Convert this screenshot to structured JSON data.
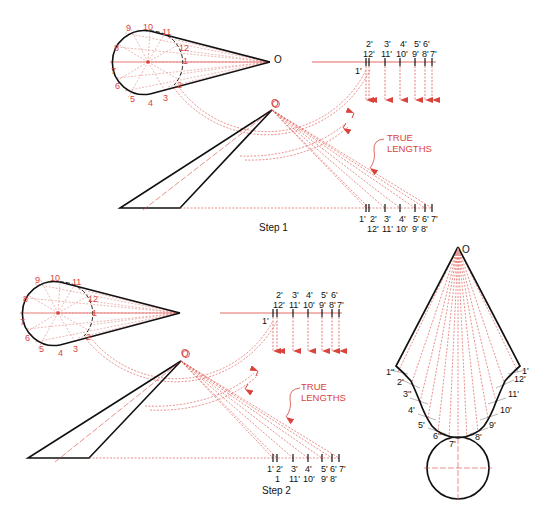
{
  "figure": {
    "colors": {
      "construction": "#d9443c",
      "outline": "#111111",
      "background": "#ffffff"
    }
  },
  "step1": {
    "caption": "Step 1",
    "apex_label": "O",
    "elevation_apex_label": "O",
    "plan_points": [
      "1",
      "2",
      "3",
      "4",
      "5",
      "6",
      "7",
      "8",
      "9",
      "10",
      "11",
      "12"
    ],
    "top_scale_upper": [
      "2'",
      "3'",
      "4'",
      "5'",
      "6'"
    ],
    "top_scale_lower": [
      "12'",
      "11'",
      "10'",
      "9'",
      "8'",
      "7'"
    ],
    "top_scale_side": "1'",
    "bottom_scale_upper": [
      "1'",
      "2'",
      "3'",
      "4'",
      "5'",
      "6'",
      "7'"
    ],
    "bottom_scale_lower": [
      "12'",
      "11'",
      "10'",
      "9'",
      "8'"
    ],
    "annotation": [
      "TRUE",
      "LENGTHS"
    ]
  },
  "step2": {
    "caption": "Step 2",
    "apex_label": "O",
    "plan_points": [
      "1",
      "2",
      "3",
      "4",
      "5",
      "6",
      "7",
      "8",
      "9",
      "10",
      "11",
      "12"
    ],
    "top_scale_upper": [
      "2'",
      "3'",
      "4'",
      "5'",
      "6'"
    ],
    "top_scale_lower": [
      "12'",
      "11'",
      "10'",
      "9'",
      "8'",
      "7'"
    ],
    "top_scale_side": "1'",
    "bottom_scale_upper": [
      "1'",
      "2'",
      "3'",
      "4'",
      "5'",
      "6'",
      "7'"
    ],
    "bottom_scale_lower": [
      "1",
      "11'",
      "10'",
      "9'",
      "8'"
    ],
    "annotation": [
      "TRUE",
      "LENGTHS"
    ]
  },
  "development": {
    "apex_label": "O",
    "left_labels": [
      "1''",
      "2'",
      "3''",
      "4'",
      "5'",
      "6''",
      "7'"
    ],
    "right_labels": [
      "1'",
      "12'",
      "11'",
      "10'",
      "9'",
      "8'"
    ]
  }
}
